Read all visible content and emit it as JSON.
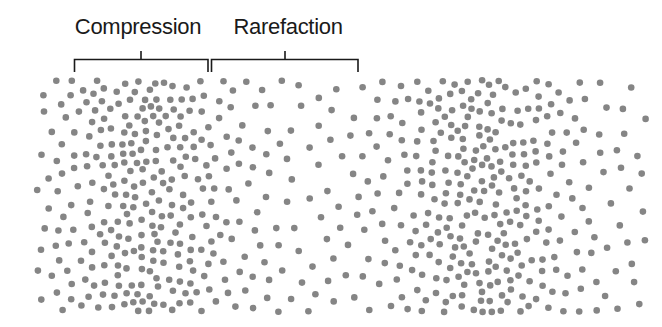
{
  "diagram": {
    "labels": {
      "compression": "Compression",
      "rarefaction": "Rarefaction"
    },
    "brackets": [
      {
        "name": "compression",
        "x1": 74,
        "x2": 208
      },
      {
        "name": "rarefaction",
        "x1": 211,
        "x2": 358
      }
    ],
    "colors": {
      "dot": "#858585",
      "bracket": "#1a1a1a",
      "text": "#1a1a1a",
      "background": "#ffffff"
    },
    "particle_field": {
      "x_range": [
        36,
        646
      ],
      "y_range": [
        80,
        312
      ],
      "dense_centers_x": [
        150,
        480
      ],
      "sparse_centers_x": [
        300,
        625
      ],
      "dot_radius": 3.3
    }
  }
}
